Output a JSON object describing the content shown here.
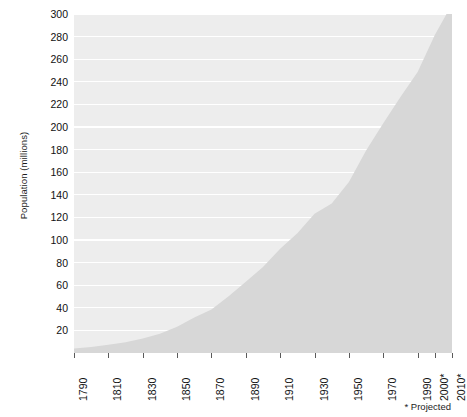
{
  "chart_data": {
    "type": "area",
    "title": "",
    "xlabel": "",
    "ylabel": "Population (millions)",
    "xlim": [
      1790,
      2010
    ],
    "ylim": [
      0,
      300
    ],
    "grid": true,
    "legend": false,
    "y_ticks": [
      300,
      280,
      260,
      240,
      220,
      200,
      180,
      160,
      140,
      120,
      100,
      80,
      60,
      40,
      20
    ],
    "x_tick_labels": [
      "1790",
      "1810",
      "1830",
      "1850",
      "1870",
      "1890",
      "1910",
      "1930",
      "1950",
      "1970",
      "1990",
      "2000*",
      "2010*"
    ],
    "x_tick_values": [
      1790,
      1810,
      1830,
      1850,
      1870,
      1890,
      1910,
      1930,
      1950,
      1970,
      1990,
      2000,
      2010
    ],
    "x": [
      1790,
      1800,
      1810,
      1820,
      1830,
      1840,
      1850,
      1860,
      1870,
      1880,
      1890,
      1900,
      1910,
      1920,
      1930,
      1940,
      1950,
      1960,
      1970,
      1980,
      1990,
      2000,
      2010
    ],
    "values": [
      3.9,
      5.3,
      7.2,
      9.6,
      12.9,
      17.1,
      23.2,
      31.4,
      38.6,
      50.2,
      63.0,
      76.2,
      92.2,
      106.0,
      123.2,
      132.2,
      151.3,
      179.3,
      203.3,
      226.5,
      248.7,
      281.4,
      308.7
    ],
    "annotations": [
      "* Projected"
    ],
    "colors": {
      "plot_background": "#ededed",
      "gridline": "#ffffff",
      "area_fill": "#d7d7d7",
      "text": "#111111",
      "page_background": "#ffffff"
    }
  },
  "footnote": {
    "text": "* Projected"
  }
}
